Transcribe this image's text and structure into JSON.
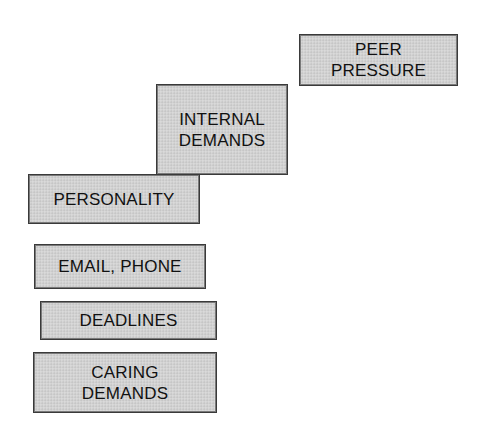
{
  "diagram": {
    "type": "staircase-boxes",
    "boxes": [
      {
        "id": "peer-pressure",
        "label": "PEER\nPRESSURE",
        "x": 299,
        "y": 34,
        "w": 159,
        "h": 52
      },
      {
        "id": "internal-demands",
        "label": "INTERNAL\nDEMANDS",
        "x": 156,
        "y": 84,
        "w": 132,
        "h": 91
      },
      {
        "id": "personality",
        "label": "PERSONALITY",
        "x": 28,
        "y": 174,
        "w": 172,
        "h": 50
      },
      {
        "id": "email-phone",
        "label": "EMAIL, PHONE",
        "x": 34,
        "y": 244,
        "w": 172,
        "h": 45
      },
      {
        "id": "deadlines",
        "label": "DEADLINES",
        "x": 40,
        "y": 301,
        "w": 177,
        "h": 39
      },
      {
        "id": "caring-demands",
        "label": "CARING\nDEMANDS",
        "x": 33,
        "y": 352,
        "w": 184,
        "h": 61
      }
    ],
    "colors": {
      "box_fill": "#d2d2d2",
      "box_border": "#3a3a3a",
      "text": "#111111",
      "background": "#ffffff"
    }
  }
}
